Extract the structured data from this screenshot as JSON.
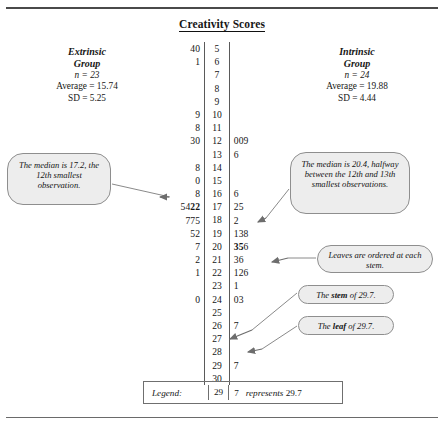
{
  "title": "Creativity Scores",
  "groups": {
    "left": {
      "name_line1": "Extrinsic",
      "name_line2": "Group",
      "n": "n = 23",
      "average": "Average = 15.74",
      "sd": "SD = 5.25"
    },
    "right": {
      "name_line1": "Intrinsic",
      "name_line2": "Group",
      "n": "n = 24",
      "average": "Average = 19.88",
      "sd": "SD = 4.44"
    }
  },
  "chart_data": {
    "type": "table",
    "title": "Creativity Scores",
    "plot_kind": "back-to-back stem-and-leaf",
    "stem_unit": "ones digit",
    "leaf_unit": "tenths digit",
    "left_label": "Extrinsic Group",
    "right_label": "Intrinsic Group",
    "stems": [
      "5",
      "6",
      "7",
      "8",
      "9",
      "10",
      "11",
      "12",
      "13",
      "14",
      "15",
      "16",
      "17",
      "18",
      "19",
      "20",
      "21",
      "22",
      "23",
      "24",
      "25",
      "26",
      "27",
      "28",
      "29",
      "30"
    ],
    "left_leaves": [
      "40",
      "1",
      "",
      "",
      "",
      "9",
      "8",
      "30",
      "",
      "8",
      "0",
      "8",
      "5422",
      "775",
      "52",
      "7",
      "2",
      "1",
      "",
      "0",
      "",
      "",
      "",
      "",
      "",
      ""
    ],
    "right_leaves": [
      "",
      "",
      "",
      "",
      "",
      "",
      "",
      "009",
      "6",
      "",
      "",
      "6",
      "25",
      "2",
      "138",
      "356",
      "36",
      "126",
      "1",
      "03",
      "",
      "7",
      "",
      "",
      "7",
      ""
    ],
    "left_median_bold_leaf": "2",
    "right_median_bold_leaf": "35",
    "left_values": [
      5.4,
      5.0,
      6.1,
      10.9,
      11.8,
      12.3,
      12.0,
      14.8,
      15.0,
      16.8,
      17.5,
      17.4,
      17.2,
      17.2,
      18.7,
      18.7,
      18.5,
      19.5,
      19.2,
      20.7,
      21.2,
      22.1,
      24.0
    ],
    "right_values": [
      12.0,
      12.0,
      12.9,
      13.6,
      16.6,
      17.2,
      17.5,
      18.2,
      19.1,
      19.3,
      19.8,
      20.3,
      20.5,
      20.6,
      21.3,
      21.6,
      22.1,
      22.2,
      22.6,
      23.1,
      24.0,
      24.3,
      26.7,
      29.7
    ],
    "left_n": 23,
    "left_mean": 15.74,
    "left_sd": 5.25,
    "left_median": 17.2,
    "right_n": 24,
    "right_mean": 19.88,
    "right_sd": 4.44,
    "right_median": 20.4
  },
  "rows": [
    {
      "left": "40",
      "stem": "5",
      "right": ""
    },
    {
      "left": "1",
      "stem": "6",
      "right": ""
    },
    {
      "left": "",
      "stem": "7",
      "right": ""
    },
    {
      "left": "",
      "stem": "8",
      "right": ""
    },
    {
      "left": "",
      "stem": "9",
      "right": ""
    },
    {
      "left": "9",
      "stem": "10",
      "right": ""
    },
    {
      "left": "8",
      "stem": "11",
      "right": ""
    },
    {
      "left": "30",
      "stem": "12",
      "right": "009"
    },
    {
      "left": "",
      "stem": "13",
      "right": "6"
    },
    {
      "left": "8",
      "stem": "14",
      "right": ""
    },
    {
      "left": "0",
      "stem": "15",
      "right": ""
    },
    {
      "left": "8",
      "stem": "16",
      "right": "6"
    },
    {
      "left": "5422",
      "stem": "17",
      "right": "25"
    },
    {
      "left": "775",
      "stem": "18",
      "right": "2"
    },
    {
      "left": "52",
      "stem": "19",
      "right": "138"
    },
    {
      "left": "7",
      "stem": "20",
      "right": "356"
    },
    {
      "left": "2",
      "stem": "21",
      "right": "36"
    },
    {
      "left": "1",
      "stem": "22",
      "right": "126"
    },
    {
      "left": "",
      "stem": "23",
      "right": "1"
    },
    {
      "left": "0",
      "stem": "24",
      "right": "03"
    },
    {
      "left": "",
      "stem": "25",
      "right": ""
    },
    {
      "left": "",
      "stem": "26",
      "right": "7"
    },
    {
      "left": "",
      "stem": "27",
      "right": ""
    },
    {
      "left": "",
      "stem": "28",
      "right": ""
    },
    {
      "left": "",
      "stem": "29",
      "right": "7"
    },
    {
      "left": "",
      "stem": "30",
      "right": ""
    }
  ],
  "callouts": {
    "left_median": "The median is 17.2, the 12th smallest observation.",
    "right_median": "The median is 20.4, halfway between the 12th and 13th smallest observations.",
    "leaves_ordered": "Leaves are ordered at each stem.",
    "stem_of": {
      "pre": "The ",
      "bold": "stem",
      "post": " of 29.7."
    },
    "leaf_of": {
      "pre": "The ",
      "bold": "leaf",
      "post": " of 29.7."
    }
  },
  "legend": {
    "label": "Legend:",
    "stem": "29",
    "leaf": "7",
    "text": "represents 29.7",
    "text_italic": "represents",
    "text_value": "29.7"
  }
}
